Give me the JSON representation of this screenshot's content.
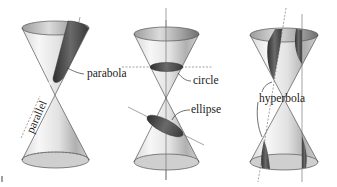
{
  "figure": {
    "panels": [
      {
        "id": "parabola-panel",
        "labels": {
          "curve": "parabola",
          "plane": "parallel"
        }
      },
      {
        "id": "circle-ellipse-panel",
        "labels": {
          "circle": "circle",
          "ellipse": "ellipse"
        }
      },
      {
        "id": "hyperbola-panel",
        "labels": {
          "curve": "hyperbola"
        }
      }
    ]
  },
  "colors": {
    "background": "#ffffff",
    "cone_light": "#f2f2f2",
    "cone_shade": "#9a9a9a",
    "section_dark": "#4a4a4a",
    "line": "#555555",
    "text": "#1a1a1a"
  }
}
